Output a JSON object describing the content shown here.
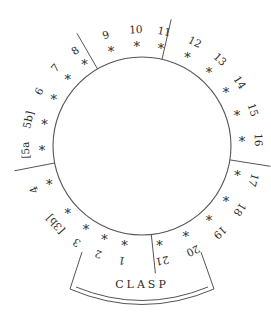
{
  "diagram": {
    "type": "circular-position-diagram",
    "center": {
      "x": 142,
      "y": 146
    },
    "radius": 89,
    "stroke_color": "#555555",
    "text_color": "#2a2a2a",
    "clasp_label": "CLASP",
    "positions": [
      {
        "label": "1",
        "angle": 100
      },
      {
        "label": "2",
        "angle": 112
      },
      {
        "label": "3",
        "angle": 124
      },
      {
        "label": "[3b]",
        "angle": 138
      },
      {
        "label": "4",
        "angle": 158
      },
      {
        "label": "[5a",
        "angle": 178
      },
      {
        "label": "5b]",
        "angle": 193
      },
      {
        "label": "6",
        "angle": 208
      },
      {
        "label": "7",
        "angle": 222
      },
      {
        "label": "8",
        "angle": 235
      },
      {
        "label": "9",
        "angle": 252
      },
      {
        "label": "10",
        "angle": 267
      },
      {
        "label": "11",
        "angle": 281
      },
      {
        "label": "12",
        "angle": 297
      },
      {
        "label": "13",
        "angle": 312
      },
      {
        "label": "14",
        "angle": 327
      },
      {
        "label": "15",
        "angle": 342
      },
      {
        "label": "16",
        "angle": 357
      },
      {
        "label": "17",
        "angle": 17
      },
      {
        "label": "18",
        "angle": 33
      },
      {
        "label": "19",
        "angle": 48
      },
      {
        "label": "20",
        "angle": 64
      },
      {
        "label": "21",
        "angle": 80
      }
    ],
    "dividers": [
      {
        "between": [
          "8",
          "9"
        ],
        "angle": 240
      },
      {
        "between": [
          "11",
          "12"
        ],
        "angle": 283
      },
      {
        "between": [
          "4",
          "[5a"
        ],
        "angle": 169
      },
      {
        "between": [
          "16",
          "17"
        ],
        "angle": 9
      },
      {
        "between": [
          "1",
          "21"
        ],
        "angle": 84
      }
    ],
    "marker_symbol": "*"
  }
}
